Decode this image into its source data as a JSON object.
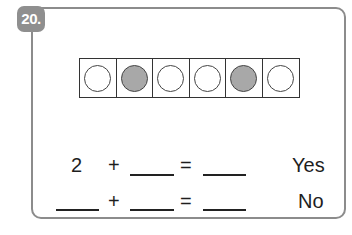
{
  "question": {
    "number": "20.",
    "ten_frame": {
      "cells": [
        {
          "filled": false
        },
        {
          "filled": true
        },
        {
          "filled": false
        },
        {
          "filled": false
        },
        {
          "filled": true
        },
        {
          "filled": false
        }
      ],
      "colors": {
        "filled": "#a8a8a8",
        "empty": "#ffffff",
        "border": "#333333"
      }
    },
    "equations": [
      {
        "addend1": "2",
        "plus": "+",
        "equals": "=",
        "answer_label": "Yes"
      },
      {
        "addend1": "",
        "plus": "+",
        "equals": "=",
        "answer_label": "No"
      }
    ]
  }
}
